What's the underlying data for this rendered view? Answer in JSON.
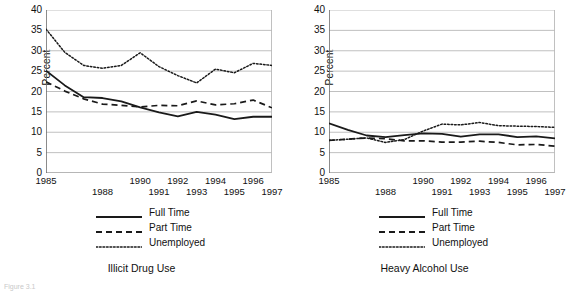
{
  "figure": {
    "caption_fragment": "Figure 3.1",
    "panels": [
      "illicit-drug-use",
      "heavy-alcohol-use"
    ]
  },
  "legend": {
    "items": [
      {
        "label": "Full Time",
        "style": "solid",
        "key": "full-time"
      },
      {
        "label": "Part Time",
        "style": "dashed",
        "key": "part-time"
      },
      {
        "label": "Unemployed",
        "style": "dotted",
        "key": "unemployed"
      }
    ]
  },
  "axis": {
    "ylabel": "Percent",
    "yticks": [
      "0",
      "5",
      "10",
      "15",
      "20",
      "25",
      "30",
      "35",
      "40"
    ],
    "xticks_top": [
      "1985",
      "1990",
      "1992",
      "1994",
      "1996"
    ],
    "xticks_bottom": [
      "1988",
      "1991",
      "1993",
      "1995",
      "1997"
    ]
  },
  "colors": {
    "line": "#1a1a1a",
    "grid": "#b9b9b9",
    "axis": "#6e6e6e",
    "background": "#ffffff"
  },
  "chart_data": [
    {
      "type": "line",
      "title": "Illicit Drug Use",
      "xlabel": "",
      "ylabel": "Percent",
      "ylim": [
        0,
        40
      ],
      "xlim": [
        1985,
        1997
      ],
      "grid": true,
      "legend_position": "below",
      "x": [
        1985,
        1986,
        1987,
        1988,
        1989,
        1990,
        1991,
        1992,
        1993,
        1994,
        1995,
        1996,
        1997
      ],
      "series": [
        {
          "name": "Full Time",
          "style": "solid",
          "values": [
            25.1,
            21.5,
            18.6,
            18.4,
            17.6,
            16.1,
            14.9,
            13.9,
            15.0,
            14.3,
            13.2,
            13.8,
            13.8
          ]
        },
        {
          "name": "Part Time",
          "style": "dashed",
          "values": [
            22.4,
            20.1,
            18.2,
            16.9,
            16.6,
            16.2,
            16.6,
            16.5,
            17.7,
            16.7,
            17.0,
            17.9,
            16.0
          ]
        },
        {
          "name": "Unemployed",
          "style": "dotted",
          "values": [
            35.3,
            29.6,
            26.4,
            25.7,
            26.4,
            29.5,
            26.1,
            23.9,
            22.1,
            25.5,
            24.6,
            26.9,
            26.4
          ]
        }
      ]
    },
    {
      "type": "line",
      "title": "Heavy Alcohol Use",
      "xlabel": "",
      "ylabel": "Percent",
      "ylim": [
        0,
        40
      ],
      "xlim": [
        1985,
        1997
      ],
      "grid": true,
      "legend_position": "below",
      "x": [
        1985,
        1986,
        1987,
        1988,
        1989,
        1990,
        1991,
        1992,
        1993,
        1994,
        1995,
        1996,
        1997
      ],
      "series": [
        {
          "name": "Full Time",
          "style": "solid",
          "values": [
            12.2,
            10.6,
            9.2,
            8.8,
            9.3,
            9.7,
            9.6,
            8.9,
            9.5,
            9.5,
            8.8,
            9.0,
            8.5
          ]
        },
        {
          "name": "Part Time",
          "style": "dashed",
          "values": [
            8.0,
            8.3,
            8.6,
            8.4,
            7.9,
            7.9,
            7.6,
            7.6,
            7.8,
            7.5,
            6.9,
            7.0,
            6.6
          ]
        },
        {
          "name": "Unemployed",
          "style": "dotted",
          "values": [
            8.0,
            8.3,
            8.6,
            7.5,
            8.2,
            10.3,
            12.0,
            11.8,
            12.4,
            11.6,
            11.5,
            11.4,
            11.2
          ]
        }
      ]
    }
  ]
}
